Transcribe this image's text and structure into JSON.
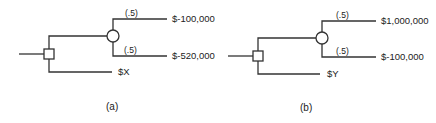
{
  "diagrams": [
    {
      "id": "a",
      "caption": "(a)",
      "decision_node": {
        "type": "square"
      },
      "chance_node": {
        "type": "circle"
      },
      "branches": {
        "gamble": {
          "outcomes": [
            {
              "probability": "(.5)",
              "payoff": "$-100,000"
            },
            {
              "probability": "(.5)",
              "payoff": "$-520,000"
            }
          ]
        },
        "certain": {
          "payoff": "$X"
        }
      }
    },
    {
      "id": "b",
      "caption": "(b)",
      "decision_node": {
        "type": "square"
      },
      "chance_node": {
        "type": "circle"
      },
      "branches": {
        "gamble": {
          "outcomes": [
            {
              "probability": "(.5)",
              "payoff": "$1,000,000"
            },
            {
              "probability": "(.5)",
              "payoff": "$-100,000"
            }
          ]
        },
        "certain": {
          "payoff": "$Y"
        }
      }
    }
  ],
  "colors": {
    "line": "#333333",
    "background": "#ffffff"
  }
}
